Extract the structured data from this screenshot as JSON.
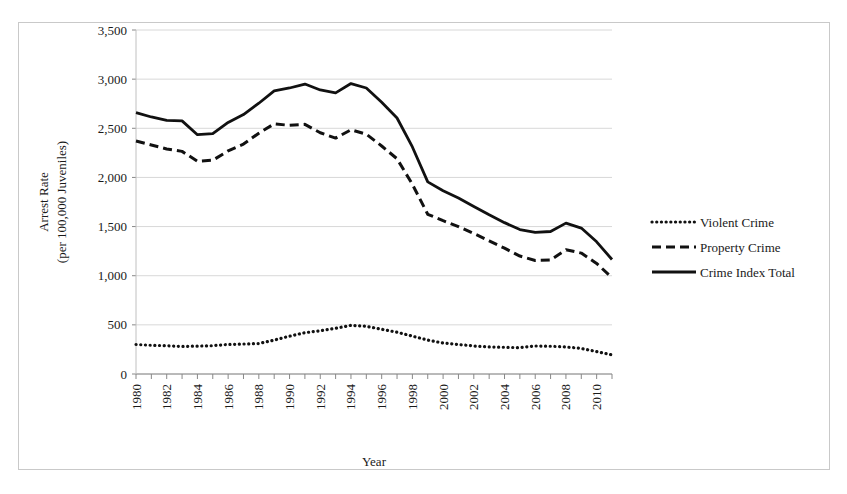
{
  "chart_data": {
    "type": "line",
    "title": "",
    "xlabel": "Year",
    "ylabel": "Arrest Rate (per 100,000 Juveniles)",
    "ylabel_line1": "Arrest Rate",
    "ylabel_line2": "(per 100,000 Juveniles)",
    "xlim": [
      1980,
      2011
    ],
    "ylim": [
      0,
      3500
    ],
    "ytick_values": [
      0,
      500,
      1000,
      1500,
      2000,
      2500,
      3000,
      3500
    ],
    "ytick_labels": [
      "0",
      "500",
      "1,000",
      "1,500",
      "2,000",
      "2,500",
      "3,000",
      "3,500"
    ],
    "xtick_values": [
      1980,
      1981,
      1982,
      1983,
      1984,
      1985,
      1986,
      1987,
      1988,
      1989,
      1990,
      1991,
      1992,
      1993,
      1994,
      1995,
      1996,
      1997,
      1998,
      1999,
      2000,
      2001,
      2002,
      2003,
      2004,
      2005,
      2006,
      2007,
      2008,
      2009,
      2010,
      2011
    ],
    "xtick_labels_shown": [
      "1980",
      "1982",
      "1984",
      "1986",
      "1988",
      "1990",
      "1992",
      "1994",
      "1996",
      "1998",
      "2000",
      "2002",
      "2004",
      "2006",
      "2008",
      "2010"
    ],
    "xtick_label_rotation": -90,
    "grid": "horizontal",
    "legend_position": "right",
    "x": [
      1980,
      1981,
      1982,
      1983,
      1984,
      1985,
      1986,
      1987,
      1988,
      1989,
      1990,
      1991,
      1992,
      1993,
      1994,
      1995,
      1996,
      1997,
      1998,
      1999,
      2000,
      2001,
      2002,
      2003,
      2004,
      2005,
      2006,
      2007,
      2008,
      2009,
      2010,
      2011
    ],
    "series": [
      {
        "name": "Violent Crime",
        "style": "dotted",
        "color": "#111111",
        "values": [
          300,
          292,
          288,
          280,
          284,
          288,
          300,
          305,
          310,
          345,
          385,
          420,
          440,
          465,
          495,
          485,
          455,
          425,
          385,
          345,
          315,
          300,
          285,
          275,
          272,
          268,
          285,
          282,
          275,
          260,
          228,
          195
        ]
      },
      {
        "name": "Property Crime",
        "style": "dashed",
        "color": "#111111",
        "values": [
          2370,
          2330,
          2290,
          2265,
          2165,
          2175,
          2270,
          2340,
          2450,
          2545,
          2530,
          2540,
          2455,
          2400,
          2485,
          2440,
          2320,
          2190,
          1930,
          1625,
          1560,
          1500,
          1430,
          1355,
          1280,
          1200,
          1155,
          1160,
          1265,
          1230,
          1125,
          980
        ]
      },
      {
        "name": "Crime Index Total",
        "style": "solid",
        "color": "#111111",
        "values": [
          2660,
          2615,
          2580,
          2575,
          2435,
          2445,
          2560,
          2640,
          2755,
          2880,
          2910,
          2950,
          2890,
          2860,
          2955,
          2910,
          2765,
          2605,
          2310,
          1955,
          1865,
          1790,
          1705,
          1620,
          1540,
          1470,
          1440,
          1450,
          1535,
          1485,
          1345,
          1165
        ]
      }
    ]
  },
  "legend": {
    "items": [
      {
        "label": "Violent Crime",
        "marker": "dotted-line-marker"
      },
      {
        "label": "Property Crime",
        "marker": "dashed-line-marker"
      },
      {
        "label": "Crime Index Total",
        "marker": "solid-line-marker"
      }
    ]
  }
}
